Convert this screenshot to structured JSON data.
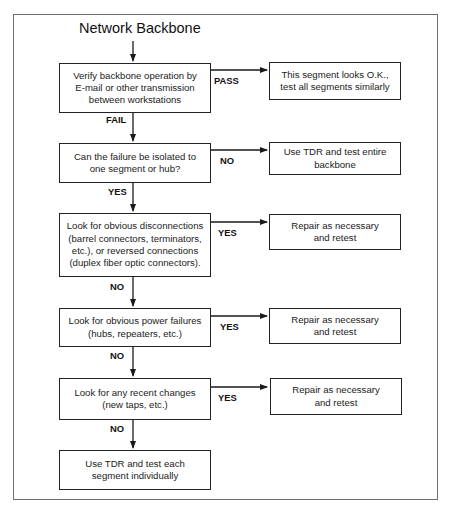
{
  "title": "Network Backbone",
  "colors": {
    "line": "#1a1a1a",
    "frame": "#6e6e6e",
    "background": "#ffffff"
  },
  "steps": [
    {
      "id": "verify",
      "lines": [
        "Verify backbone operation by",
        "E-mail or other transmission",
        "between workstations"
      ],
      "branch_label": "PASS",
      "down_label": "FAIL",
      "outcome": {
        "lines": [
          "This segment looks O.K.,",
          "test all segments similarly"
        ]
      }
    },
    {
      "id": "isolate",
      "lines": [
        "Can the failure be isolated to",
        "one segment or hub?"
      ],
      "branch_label": "NO",
      "down_label": "YES",
      "outcome": {
        "lines": [
          "Use TDR and test entire",
          "backbone"
        ]
      }
    },
    {
      "id": "disconnections",
      "lines": [
        "Look for obvious disconnections",
        "(barrel connectors, terminators,",
        "etc.), or reversed connections",
        "(duplex fiber optic connectors)."
      ],
      "branch_label": "YES",
      "down_label": "NO",
      "outcome": {
        "lines": [
          "Repair as necessary",
          "and retest"
        ]
      }
    },
    {
      "id": "power",
      "lines": [
        "Look for obvious power failures",
        "(hubs, repeaters, etc.)"
      ],
      "branch_label": "YES",
      "down_label": "NO",
      "outcome": {
        "lines": [
          "Repair as necessary",
          "and retest"
        ]
      }
    },
    {
      "id": "changes",
      "lines": [
        "Look for any recent changes",
        "(new taps, etc.)"
      ],
      "branch_label": "YES",
      "down_label": "NO",
      "outcome": {
        "lines": [
          "Repair as necessary",
          "and retest"
        ]
      }
    },
    {
      "id": "final",
      "lines": [
        "Use TDR and test each",
        "segment individually"
      ]
    }
  ]
}
